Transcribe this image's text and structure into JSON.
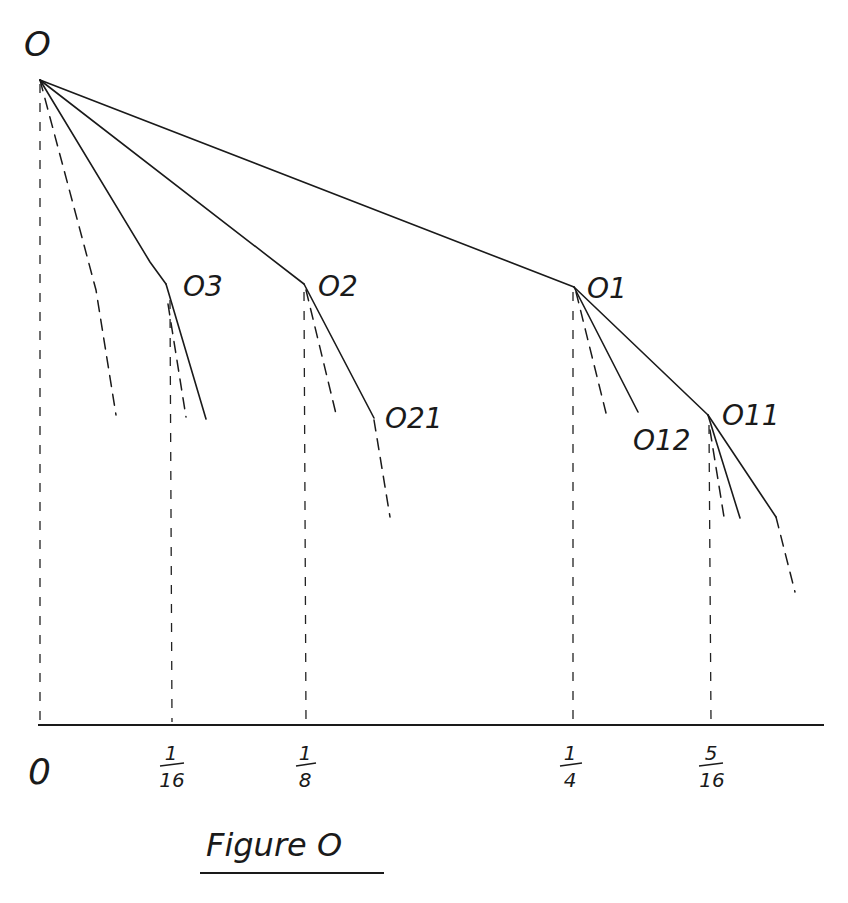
{
  "figure": {
    "caption": "Figure O",
    "root_label": "O",
    "axis": {
      "tick_labels": [
        {
          "num": "0",
          "den": "",
          "x": 40
        },
        {
          "num": "1",
          "den": "16",
          "x": 172
        },
        {
          "num": "1",
          "den": "8",
          "x": 306
        },
        {
          "num": "1",
          "den": "4",
          "x": 572
        },
        {
          "num": "5",
          "den": "16",
          "x": 711
        }
      ]
    },
    "nodes": [
      {
        "id": "root",
        "label": "O",
        "x": 40,
        "y": 80
      },
      {
        "id": "n03",
        "label": "O3",
        "x": 166,
        "y": 284
      },
      {
        "id": "n02",
        "label": "O2",
        "x": 304,
        "y": 284
      },
      {
        "id": "n01",
        "label": "O1",
        "x": 574,
        "y": 287
      },
      {
        "id": "n021",
        "label": "O21",
        "x": 374,
        "y": 418
      },
      {
        "id": "n012",
        "label": "O12",
        "x": 638,
        "y": 412
      },
      {
        "id": "n011",
        "label": "O11",
        "x": 708,
        "y": 415
      }
    ],
    "labels": {
      "root": "O",
      "n03": "O3",
      "n02": "O2",
      "n01": "O1",
      "n021": "O21",
      "n012": "O12",
      "n011": "O11",
      "tick0": "0",
      "tick1_num": "1",
      "tick1_den": "16",
      "tick2_num": "1",
      "tick2_den": "8",
      "tick3_num": "1",
      "tick3_den": "4",
      "tick4_num": "5",
      "tick4_den": "16"
    }
  }
}
